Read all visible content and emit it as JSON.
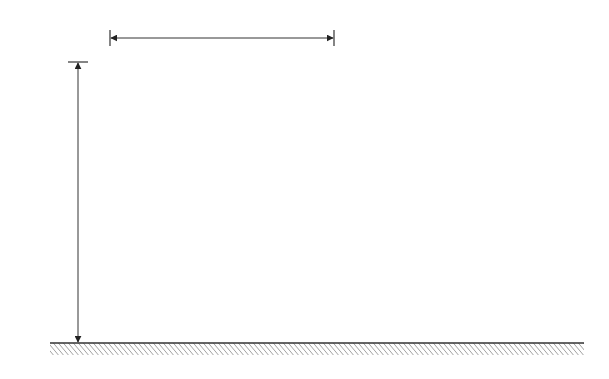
{
  "figure": {
    "width_label": "L",
    "height_label": "20 ft",
    "spacing_label": "S",
    "spacing_subscript": "v",
    "layer_count": 7,
    "pressure_arrow_count": 15,
    "colors": {
      "line": "#3a3a3a",
      "background": "#ffffff",
      "text": "#333333"
    }
  }
}
